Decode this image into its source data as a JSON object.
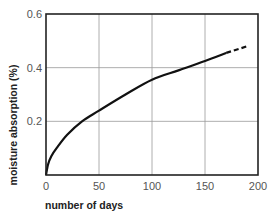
{
  "chart_data": {
    "type": "line",
    "title": "",
    "xlabel": "number of days",
    "ylabel": "moisture absorption (%)",
    "xlim": [
      0,
      200
    ],
    "ylim": [
      0,
      0.6
    ],
    "x_ticks": [
      "0",
      "50",
      "100",
      "150",
      "200"
    ],
    "y_ticks": [
      "0.2",
      "0.4",
      "0.6"
    ],
    "grid": true,
    "legend": null,
    "series": [
      {
        "name": "measured",
        "style": "solid",
        "x": [
          0,
          2,
          5,
          10,
          20,
          34,
          50,
          75,
          100,
          125,
          150,
          170
        ],
        "y": [
          0,
          0.04,
          0.07,
          0.1,
          0.15,
          0.2,
          0.24,
          0.3,
          0.355,
          0.39,
          0.425,
          0.455
        ]
      },
      {
        "name": "extrapolated",
        "style": "dashed",
        "x": [
          170,
          190
        ],
        "y": [
          0.455,
          0.48
        ]
      }
    ]
  },
  "colors": {
    "curve": "#111111",
    "frame": "#222222",
    "grid": "#999999",
    "tick_text": "#555555"
  }
}
